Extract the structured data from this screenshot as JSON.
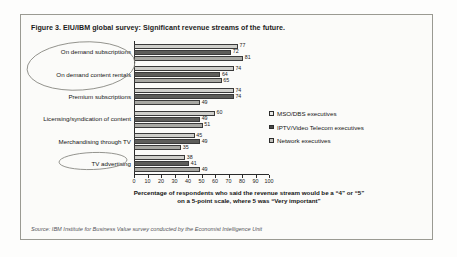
{
  "figure": {
    "title": "Figure 3. EIU/IBM global survey: Significant revenue streams of the future.",
    "source": "Source: IBM Institute for Business Value survey conducted by the Economist Intelligence Unit"
  },
  "annotations": [
    {
      "name": "ellipse-on-demand-labels",
      "note": "hand-drawn oval around the two On demand category labels"
    },
    {
      "name": "ellipse-tv-advertising-label",
      "note": "hand-drawn oval around the TV advertising category label"
    }
  ],
  "colors": {
    "series_mso": "#cfcfcb",
    "series_iptv": "#5d5d5a",
    "series_network": "#a8a8a3",
    "axis": "#2a2a2a",
    "frame": "#9a9a92"
  },
  "chart_data": {
    "type": "bar",
    "orientation": "horizontal",
    "title": "Figure 3. EIU/IBM global survey: Significant revenue streams of the future.",
    "xlabel": "Percentage of respondents who said the revenue stream would be a \"4\" or \"5\" on a 5-point scale, where 5 was \"Very important\"",
    "xlabel_line1": "Percentage of respondents who said the revenue stream would be a “4” or “5”",
    "xlabel_line2": "on a 5-point scale, where 5 was “Very important”",
    "ylabel": "",
    "xlim": [
      0,
      100
    ],
    "xticks": [
      0,
      10,
      20,
      30,
      40,
      50,
      60,
      70,
      80,
      90,
      100
    ],
    "grid": false,
    "legend_position": "right",
    "categories": [
      "On demand subscriptions",
      "On demand content rentals",
      "Premium subscriptions",
      "Licensing/syndication of content",
      "Merchandising through TV",
      "TV advertising"
    ],
    "series": [
      {
        "name": "MSO/DBS executives",
        "values": [
          77,
          74,
          74,
          60,
          45,
          38
        ]
      },
      {
        "name": "IPTV/Video Telecom executives",
        "values": [
          72,
          64,
          74,
          49,
          49,
          41
        ]
      },
      {
        "name": "Network executives",
        "values": [
          81,
          65,
          49,
          51,
          35,
          49
        ]
      }
    ]
  }
}
